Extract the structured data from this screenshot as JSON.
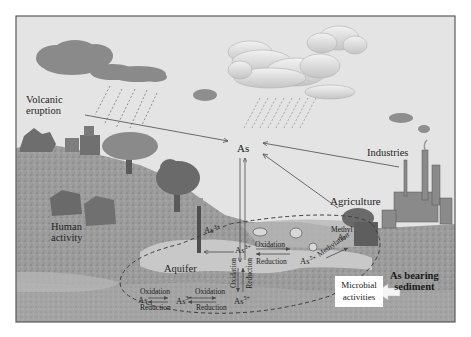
{
  "diagram": {
    "title": "",
    "type": "arsenic biogeochemical cycle illustration",
    "colors": {
      "sky": "#e4e4e4",
      "dark_cloud": "#8a8a8a",
      "light_cloud": "#d2d2d2",
      "ground": "#9a9a9a",
      "aquifer": "#c4c4c4",
      "line": "#4a4a4a",
      "frame": "#5a5a5a"
    },
    "sources": {
      "volcanic": "Volcanic eruption",
      "volcanic_line1": "Volcanic",
      "volcanic_line2": "eruption",
      "industries": "Industries",
      "agriculture": "Agriculture",
      "human_line1": "Human",
      "human_line2": "activity"
    },
    "center": {
      "as": "As",
      "as3_well": "As",
      "as3_well_sup": "3+"
    },
    "aquifer_label": "Aquifer",
    "upper_cycle": {
      "as3": "As",
      "as3_sup": "3+",
      "oxidation": "Oxidation",
      "reduction": "Reduction",
      "as5": "As",
      "as5_sup": "5+",
      "vertical_oxidation": "Oxidation",
      "vertical_reduction": "Reduction",
      "methyl_line1": "Methyl",
      "methyl_line2": "As",
      "methylation": "Methylation"
    },
    "lower_cycle": {
      "as": "As",
      "as3": "As",
      "as3_sup": "3+",
      "as5": "As",
      "as5_sup": "5+",
      "oxidation_1": "Oxidation",
      "reduction_1": "Reduction",
      "oxidation_2": "Oxidation",
      "reduction_2": "Reduction"
    },
    "microbial_line1": "Microbial",
    "microbial_line2": "activities",
    "sediment_line1": "As bearing",
    "sediment_line2": "sediment"
  }
}
